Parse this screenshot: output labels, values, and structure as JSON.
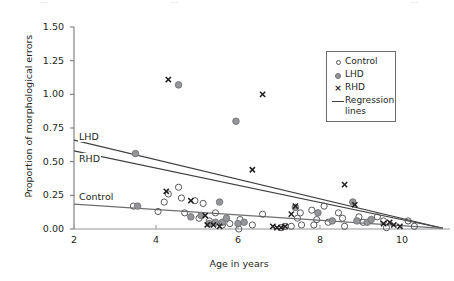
{
  "top_clipped_text": "clipped caption text",
  "chart_data": {
    "type": "scatter",
    "title": "",
    "xlabel": "Age in years",
    "ylabel": "Proportion of morphological errors",
    "xlim": [
      2,
      11
    ],
    "ylim": [
      0,
      1.5
    ],
    "xticks": [
      2,
      4,
      6,
      8,
      10
    ],
    "xtick_labels": [
      "2",
      "4",
      "6",
      "8",
      "10"
    ],
    "yticks": [
      0.0,
      0.25,
      0.5,
      0.75,
      1.0,
      1.25,
      1.5
    ],
    "ytick_labels": [
      "0.00",
      "0.25",
      "0.50",
      "0.75",
      "1.00",
      "1.25",
      "1.50"
    ],
    "grid": false,
    "legend_position": "top-right",
    "legend": [
      {
        "label": "Control",
        "marker": "open-circle",
        "color": "#58595b"
      },
      {
        "label": "LHD",
        "marker": "filled-circle",
        "color": "#939598"
      },
      {
        "label": "RHD",
        "marker": "cross",
        "color": "#231f20"
      },
      {
        "label": "Regression\nlines",
        "marker": "line",
        "color": "#3f3f3f"
      }
    ],
    "series": [
      {
        "name": "Control",
        "marker": "open-circle",
        "color": "#58595b",
        "points": [
          [
            3.45,
            0.17
          ],
          [
            4.05,
            0.13
          ],
          [
            4.2,
            0.2
          ],
          [
            4.3,
            0.26
          ],
          [
            4.55,
            0.31
          ],
          [
            4.62,
            0.23
          ],
          [
            4.7,
            0.12
          ],
          [
            4.95,
            0.21
          ],
          [
            5.05,
            0.08
          ],
          [
            5.15,
            0.19
          ],
          [
            5.3,
            0.06
          ],
          [
            5.45,
            0.12
          ],
          [
            5.62,
            0.03
          ],
          [
            5.8,
            0.04
          ],
          [
            6.02,
            0.0
          ],
          [
            6.05,
            0.07
          ],
          [
            6.35,
            0.03
          ],
          [
            6.6,
            0.11
          ],
          [
            7.05,
            0.01
          ],
          [
            7.15,
            0.02
          ],
          [
            7.3,
            0.02
          ],
          [
            7.45,
            0.08
          ],
          [
            7.52,
            0.12
          ],
          [
            7.55,
            0.03
          ],
          [
            7.8,
            0.14
          ],
          [
            7.85,
            0.03
          ],
          [
            7.92,
            0.07
          ],
          [
            8.1,
            0.17
          ],
          [
            8.2,
            0.05
          ],
          [
            8.45,
            0.12
          ],
          [
            8.55,
            0.08
          ],
          [
            8.6,
            0.02
          ],
          [
            8.95,
            0.09
          ],
          [
            9.05,
            0.05
          ],
          [
            9.4,
            0.09
          ],
          [
            9.55,
            0.06
          ],
          [
            9.62,
            0.01
          ],
          [
            10.15,
            0.06
          ],
          [
            10.3,
            0.02
          ]
        ]
      },
      {
        "name": "LHD",
        "marker": "filled-circle",
        "color": "#939598",
        "points": [
          [
            3.5,
            0.56
          ],
          [
            4.55,
            1.07
          ],
          [
            3.55,
            0.17
          ],
          [
            4.85,
            0.09
          ],
          [
            5.1,
            0.1
          ],
          [
            5.3,
            0.04
          ],
          [
            5.45,
            0.05
          ],
          [
            5.55,
            0.2
          ],
          [
            5.62,
            0.05
          ],
          [
            5.72,
            0.08
          ],
          [
            5.95,
            0.8
          ],
          [
            6.0,
            0.04
          ],
          [
            6.15,
            0.05
          ],
          [
            7.4,
            0.16
          ],
          [
            7.95,
            0.12
          ],
          [
            8.3,
            0.06
          ],
          [
            8.8,
            0.2
          ],
          [
            8.9,
            0.06
          ],
          [
            9.15,
            0.05
          ],
          [
            9.25,
            0.07
          ]
        ]
      },
      {
        "name": "RHD",
        "marker": "cross",
        "color": "#231f20",
        "points": [
          [
            4.3,
            1.11
          ],
          [
            6.6,
            1.0
          ],
          [
            4.25,
            0.28
          ],
          [
            4.85,
            0.21
          ],
          [
            5.2,
            0.1
          ],
          [
            5.25,
            0.03
          ],
          [
            5.4,
            0.03
          ],
          [
            5.55,
            0.02
          ],
          [
            6.85,
            0.02
          ],
          [
            6.95,
            0.01
          ],
          [
            7.05,
            0.01
          ],
          [
            7.15,
            0.02
          ],
          [
            6.35,
            0.44
          ],
          [
            7.3,
            0.11
          ],
          [
            7.4,
            0.17
          ],
          [
            8.6,
            0.33
          ],
          [
            8.85,
            0.18
          ],
          [
            9.55,
            0.04
          ],
          [
            9.7,
            0.05
          ],
          [
            9.8,
            0.03
          ],
          [
            9.95,
            0.02
          ]
        ]
      }
    ],
    "regression_lines": [
      {
        "name": "LHD",
        "x0": 2.0,
        "y0": 0.66,
        "x1": 11.0,
        "y1": 0.005,
        "label": "LHD",
        "color": "#3f3f3f"
      },
      {
        "name": "RHD",
        "x0": 2.0,
        "y0": 0.58,
        "x1": 11.0,
        "y1": 0.005,
        "label": "RHD",
        "color": "#3f3f3f"
      },
      {
        "name": "Control",
        "x0": 2.0,
        "y0": 0.185,
        "x1": 11.0,
        "y1": 0.005,
        "label": "Control",
        "color": "#6d6e71"
      }
    ],
    "line_tags": [
      {
        "label": "LHD",
        "x_px": 78,
        "y_px": 131
      },
      {
        "label": "RHD",
        "x_px": 78,
        "y_px": 153
      },
      {
        "label": "Control",
        "x_px": 78,
        "y_px": 191
      }
    ]
  }
}
